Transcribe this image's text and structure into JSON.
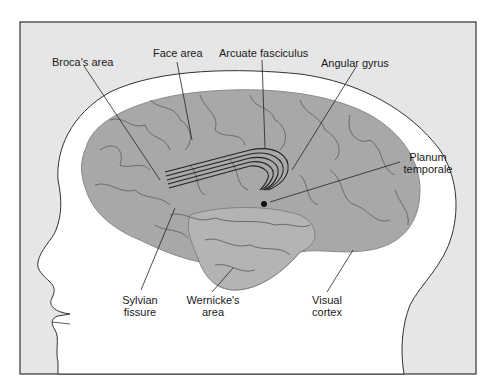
{
  "diagram": {
    "colors": {
      "background": "#e6e6e6",
      "head": "#ffffff",
      "brain": "#a9a9a9",
      "outline": "#333333"
    },
    "labels": {
      "broca": "Broca's area",
      "face": "Face area",
      "arcuate": "Arcuate fasciculus",
      "angular": "Angular gyrus",
      "planum_1": "Planum",
      "planum_2": "temporale",
      "sylvian_1": "Sylvian",
      "sylvian_2": "fissure",
      "wernicke_1": "Wernicke's",
      "wernicke_2": "area",
      "visual_1": "Visual",
      "visual_2": "cortex"
    }
  }
}
